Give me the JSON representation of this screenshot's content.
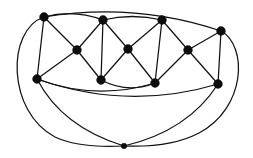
{
  "figure": {
    "kind": "graph-diagram",
    "title": "",
    "background_color": "#ffffff",
    "ink_color": "#111111",
    "canvas": {
      "width": 253,
      "height": 158
    }
  },
  "graph": {
    "vertex_count": 12,
    "edge_count": 26,
    "vertex_radius": 4.2,
    "vertex_radius_small": 2.6,
    "vertices": [
      {
        "id": "v1",
        "label": "",
        "name": "vertex-top-left",
        "x": 44,
        "y": 17,
        "r": 4.4
      },
      {
        "id": "v2",
        "label": "",
        "name": "vertex-top-mid-left",
        "x": 103,
        "y": 20,
        "r": 4.4
      },
      {
        "id": "v3",
        "label": "",
        "name": "vertex-top-mid-right",
        "x": 162,
        "y": 20,
        "r": 4.4
      },
      {
        "id": "v4",
        "label": "",
        "name": "vertex-top-right",
        "x": 221,
        "y": 31,
        "r": 4.4
      },
      {
        "id": "v5",
        "label": "",
        "name": "vertex-mid-left",
        "x": 77,
        "y": 50,
        "r": 4.4
      },
      {
        "id": "v6",
        "label": "",
        "name": "vertex-mid-center",
        "x": 128,
        "y": 49,
        "r": 4.4
      },
      {
        "id": "v7",
        "label": "",
        "name": "vertex-mid-right",
        "x": 188,
        "y": 50,
        "r": 4.4
      },
      {
        "id": "v8",
        "label": "",
        "name": "vertex-low-left",
        "x": 37,
        "y": 79,
        "r": 4.4
      },
      {
        "id": "v9",
        "label": "",
        "name": "vertex-low-mid-left",
        "x": 101,
        "y": 80,
        "r": 4.4
      },
      {
        "id": "v10",
        "label": "",
        "name": "vertex-low-mid-right",
        "x": 155,
        "y": 83,
        "r": 4.4
      },
      {
        "id": "v11",
        "label": "",
        "name": "vertex-low-right",
        "x": 218,
        "y": 84,
        "r": 4.4
      },
      {
        "id": "v12",
        "label": "",
        "name": "vertex-bottom",
        "x": 124,
        "y": 146,
        "r": 2.8
      }
    ],
    "edges": [
      {
        "id": "e1",
        "name": "edge-v1-v5",
        "from": "v1",
        "to": "v5",
        "type": "straight",
        "d": "M 44 17 L 77 50"
      },
      {
        "id": "e2",
        "name": "edge-v1-v8",
        "from": "v1",
        "to": "v8",
        "type": "straight",
        "d": "M 44 17 L 37 79"
      },
      {
        "id": "e3",
        "name": "edge-v5-v8",
        "from": "v5",
        "to": "v8",
        "type": "straight",
        "d": "M 77 50 L 37 79"
      },
      {
        "id": "e4",
        "name": "edge-v5-v2",
        "from": "v5",
        "to": "v2",
        "type": "straight",
        "d": "M 77 50 L 103 20"
      },
      {
        "id": "e5",
        "name": "edge-v5-v9",
        "from": "v5",
        "to": "v9",
        "type": "straight",
        "d": "M 77 50 L 101 80"
      },
      {
        "id": "e6",
        "name": "edge-v2-v9",
        "from": "v2",
        "to": "v9",
        "type": "straight",
        "d": "M 103 20 L 101 80"
      },
      {
        "id": "e7",
        "name": "edge-v2-v6",
        "from": "v2",
        "to": "v6",
        "type": "straight",
        "d": "M 103 20 L 128 49"
      },
      {
        "id": "e8",
        "name": "edge-v6-v9",
        "from": "v6",
        "to": "v9",
        "type": "straight",
        "d": "M 128 49 L 101 80"
      },
      {
        "id": "e9",
        "name": "edge-v6-v10",
        "from": "v6",
        "to": "v10",
        "type": "straight",
        "d": "M 128 49 L 155 83"
      },
      {
        "id": "e10",
        "name": "edge-v6-v3",
        "from": "v6",
        "to": "v3",
        "type": "straight",
        "d": "M 128 49 L 162 20"
      },
      {
        "id": "e11",
        "name": "edge-v3-v10",
        "from": "v3",
        "to": "v10",
        "type": "straight",
        "d": "M 162 20 L 155 83"
      },
      {
        "id": "e12",
        "name": "edge-v3-v7",
        "from": "v3",
        "to": "v7",
        "type": "straight",
        "d": "M 162 20 L 188 50"
      },
      {
        "id": "e13",
        "name": "edge-v7-v10",
        "from": "v7",
        "to": "v10",
        "type": "straight",
        "d": "M 188 50 L 155 83"
      },
      {
        "id": "e14",
        "name": "edge-v7-v4",
        "from": "v7",
        "to": "v4",
        "type": "straight",
        "d": "M 188 50 L 221 31"
      },
      {
        "id": "e15",
        "name": "edge-v7-v11",
        "from": "v7",
        "to": "v11",
        "type": "straight",
        "d": "M 188 50 L 218 84"
      },
      {
        "id": "e16",
        "name": "edge-v4-v11",
        "from": "v4",
        "to": "v11",
        "type": "straight",
        "d": "M 221 31 L 218 84"
      },
      {
        "id": "e17",
        "name": "edge-v1-v2",
        "from": "v1",
        "to": "v2",
        "type": "curve",
        "d": "M 44 17 Q 73 9 103 20"
      },
      {
        "id": "e18",
        "name": "edge-v2-v3",
        "from": "v2",
        "to": "v3",
        "type": "curve",
        "d": "M 103 20 Q 132 13 162 20"
      },
      {
        "id": "e19",
        "name": "edge-v1-v4",
        "from": "v1",
        "to": "v4",
        "type": "curve",
        "d": "M 44 17 Q 135 2 221 31"
      },
      {
        "id": "e20",
        "name": "edge-v9-v10",
        "from": "v9",
        "to": "v10",
        "type": "curve",
        "d": "M 101 80 Q 128 94 155 83"
      },
      {
        "id": "e21",
        "name": "edge-v8-v11",
        "from": "v8",
        "to": "v11",
        "type": "curve",
        "d": "M 37 79 Q 128 111 218 84"
      },
      {
        "id": "e22",
        "name": "edge-v8-v10",
        "from": "v8",
        "to": "v10",
        "type": "curve",
        "d": "M 37 79 Q 96 101 155 83"
      },
      {
        "id": "e23",
        "name": "edge-v8-v12",
        "from": "v8",
        "to": "v12",
        "type": "curve",
        "d": "M 37 79 Q 62 127 124 146"
      },
      {
        "id": "e24",
        "name": "edge-v11-v12",
        "from": "v11",
        "to": "v12",
        "type": "curve",
        "d": "M 218 84 Q 188 131 124 146"
      },
      {
        "id": "e25",
        "name": "edge-v1-v12-outer",
        "from": "v1",
        "to": "v12",
        "type": "outer-curve",
        "d": "M 44 17 C 6 30 7 112 55 137 C 76 147 103 147 124 146"
      },
      {
        "id": "e26",
        "name": "edge-v4-v12-outer",
        "from": "v4",
        "to": "v12",
        "type": "outer-curve",
        "d": "M 221 31 C 248 46 246 108 199 133 C 176 145 147 147 124 146"
      }
    ]
  }
}
